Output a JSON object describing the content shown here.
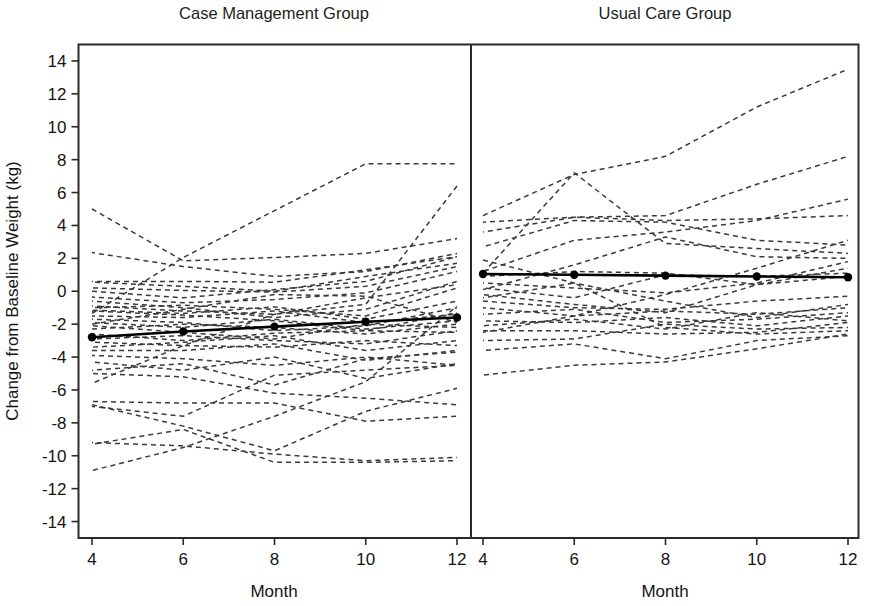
{
  "chart_data": {
    "type": "line",
    "title": "",
    "xlabel": "Month",
    "ylabel": "Change from Baseline Weight (kg)",
    "xlim": [
      3.6,
      12.4
    ],
    "ylim": [
      -15,
      15
    ],
    "xticks": [
      4,
      6,
      8,
      10,
      12
    ],
    "xtick_labels": [
      "4",
      "6",
      "8",
      "10",
      "12"
    ],
    "yticks": [
      14,
      12,
      10,
      8,
      6,
      4,
      2,
      0,
      -2,
      -4,
      -6,
      -8,
      -10,
      -12,
      -14
    ],
    "ytick_labels": [
      "14",
      "12",
      "10",
      "8",
      "6",
      "4",
      "2",
      "0",
      "-2",
      "-4",
      "-6",
      "-8",
      "-10",
      "-12",
      "-14"
    ],
    "grid": false,
    "legend": "none",
    "x": [
      4,
      6,
      8,
      10,
      12
    ],
    "panels": [
      {
        "name": "case-management",
        "title": "Case Management Group",
        "xlabel": "Month",
        "mean_series": {
          "name": "Case Management mean",
          "values": [
            -2.8,
            -2.45,
            -2.15,
            -1.85,
            -1.6
          ],
          "style": "solid-bold-with-markers"
        },
        "individual_series": [
          {
            "values": [
              5.0,
              1.85,
              2.05,
              2.3,
              3.2
            ]
          },
          {
            "values": [
              2.35,
              1.5,
              0.9,
              1.2,
              2.3
            ]
          },
          {
            "values": [
              0.6,
              0.6,
              0.55,
              1.3,
              2.1
            ]
          },
          {
            "values": [
              0.55,
              0.3,
              0.0,
              0.9,
              1.7
            ]
          },
          {
            "values": [
              0.2,
              0.05,
              -0.05,
              0.3,
              1.5
            ]
          },
          {
            "values": [
              0.0,
              -0.4,
              0.1,
              0.6,
              2.1
            ]
          },
          {
            "values": [
              -0.35,
              -0.7,
              -0.5,
              -0.1,
              1.2
            ]
          },
          {
            "values": [
              -0.9,
              -1.2,
              -1.4,
              -0.8,
              6.4
            ]
          },
          {
            "values": [
              -1.0,
              -0.85,
              -1.1,
              -1.5,
              0.2
            ]
          },
          {
            "values": [
              -1.15,
              -1.35,
              -0.95,
              -1.7,
              -0.6
            ]
          },
          {
            "values": [
              -1.35,
              2.05,
              4.9,
              7.75,
              7.75
            ]
          },
          {
            "values": [
              -1.5,
              -1.6,
              -1.2,
              -1.9,
              -1.4
            ]
          },
          {
            "values": [
              -1.7,
              -1.9,
              -2.4,
              -2.1,
              -1.0
            ]
          },
          {
            "values": [
              -1.9,
              -2.2,
              -1.7,
              -2.3,
              -1.8
            ]
          },
          {
            "values": [
              -2.1,
              -2.5,
              -2.9,
              -2.0,
              -2.2
            ]
          },
          {
            "values": [
              -2.3,
              -2.0,
              -2.2,
              -2.6,
              -2.0
            ]
          },
          {
            "values": [
              -2.6,
              -3.0,
              -2.55,
              -2.4,
              -2.5
            ]
          },
          {
            "values": [
              -2.9,
              -2.7,
              -3.0,
              -3.2,
              -2.4
            ]
          },
          {
            "values": [
              -3.1,
              -3.3,
              -3.4,
              -3.0,
              -3.3
            ]
          },
          {
            "values": [
              -3.4,
              -3.1,
              -2.7,
              -3.6,
              -3.0
            ]
          },
          {
            "values": [
              -3.6,
              -3.6,
              -3.2,
              -4.2,
              -3.6
            ]
          },
          {
            "values": [
              -3.9,
              -4.1,
              -4.5,
              -4.0,
              -4.5
            ]
          },
          {
            "values": [
              -4.8,
              -4.4,
              -5.7,
              -4.1,
              -3.7
            ]
          },
          {
            "values": [
              -5.6,
              -3.3,
              -1.4,
              -0.4,
              0.4
            ]
          },
          {
            "values": [
              -6.7,
              -6.8,
              -6.8,
              -7.9,
              -7.6
            ]
          },
          {
            "values": [
              -6.9,
              -8.2,
              -9.7,
              -7.3,
              -5.9
            ]
          },
          {
            "values": [
              -7.0,
              -7.6,
              -5.1,
              -4.8,
              -4.5
            ]
          },
          {
            "values": [
              -9.2,
              -9.4,
              -9.9,
              -10.3,
              -10.1
            ]
          },
          {
            "values": [
              -9.3,
              -8.4,
              -10.4,
              -10.4,
              -10.3
            ]
          },
          {
            "values": [
              -10.9,
              -9.5,
              -7.6,
              -5.5,
              -0.9
            ]
          },
          {
            "values": [
              -2.0,
              -1.1,
              -0.2,
              -0.3,
              -1.9
            ]
          },
          {
            "values": [
              -1.2,
              -1.45,
              -1.8,
              -2.4,
              -1.3
            ]
          },
          {
            "values": [
              -0.6,
              -1.0,
              -1.6,
              -1.1,
              0.6
            ]
          },
          {
            "values": [
              -4.3,
              -4.8,
              -4.0,
              -5.3,
              -4.4
            ]
          },
          {
            "values": [
              -5.0,
              -5.2,
              -6.2,
              -6.5,
              -6.9
            ]
          }
        ]
      },
      {
        "name": "usual-care",
        "title": "Usual Care Group",
        "xlabel": "Month",
        "mean_series": {
          "name": "Usual Care mean",
          "values": [
            1.05,
            1.0,
            0.95,
            0.9,
            0.85
          ],
          "style": "solid-bold-with-markers"
        },
        "individual_series": [
          {
            "values": [
              4.6,
              7.1,
              8.2,
              11.2,
              13.5
            ]
          },
          {
            "values": [
              4.2,
              4.5,
              4.6,
              6.5,
              8.2
            ]
          },
          {
            "values": [
              3.6,
              4.5,
              4.3,
              4.4,
              4.6
            ]
          },
          {
            "values": [
              2.7,
              4.3,
              4.2,
              3.1,
              2.8
            ]
          },
          {
            "values": [
              1.2,
              3.1,
              3.6,
              4.3,
              5.6
            ]
          },
          {
            "values": [
              1.1,
              7.2,
              2.9,
              2.6,
              2.3
            ]
          },
          {
            "values": [
              0.9,
              1.2,
              1.1,
              0.4,
              1.4
            ]
          },
          {
            "values": [
              0.5,
              0.2,
              -0.1,
              0.5,
              1.8
            ]
          },
          {
            "values": [
              0.2,
              -0.4,
              1.0,
              0.9,
              1.1
            ]
          },
          {
            "values": [
              -0.2,
              -0.8,
              -1.3,
              0.4,
              0.9
            ]
          },
          {
            "values": [
              -0.6,
              -1.0,
              -1.1,
              -0.6,
              -0.3
            ]
          },
          {
            "values": [
              -1.0,
              -1.5,
              -1.2,
              -1.4,
              -1.0
            ]
          },
          {
            "values": [
              -1.4,
              -1.1,
              -1.9,
              -1.7,
              -1.3
            ]
          },
          {
            "values": [
              -1.8,
              -1.9,
              -1.6,
              -2.1,
              -1.5
            ]
          },
          {
            "values": [
              -2.1,
              -1.7,
              -2.3,
              -1.3,
              -1.8
            ]
          },
          {
            "values": [
              -2.4,
              -2.4,
              -2.6,
              -2.5,
              -1.9
            ]
          },
          {
            "values": [
              -2.5,
              -1.5,
              -0.2,
              1.4,
              3.1
            ]
          },
          {
            "values": [
              -3.0,
              -2.9,
              -2.0,
              -2.3,
              -2.2
            ]
          },
          {
            "values": [
              -3.6,
              -3.2,
              -4.1,
              -3.0,
              -2.7
            ]
          },
          {
            "values": [
              -5.1,
              -4.5,
              -4.3,
              -3.5,
              -2.6
            ]
          },
          {
            "values": [
              1.9,
              0.5,
              -0.6,
              -1.6,
              -0.8
            ]
          },
          {
            "values": [
              0.1,
              1.6,
              3.3,
              2.1,
              2.0
            ]
          },
          {
            "values": [
              -0.4,
              0.5,
              -2.2,
              -2.6,
              -2.4
            ]
          }
        ]
      }
    ]
  },
  "layout": {
    "panel_left_title": "Case Management Group",
    "panel_right_title": "Usual Care Group",
    "y_axis_title": "Change from Baseline Weight (kg)",
    "x_axis_title_left": "Month",
    "x_axis_title_right": "Month"
  },
  "colors": {
    "frame": "#2a2a2a",
    "mean_line": "#000000",
    "individual_line": "#3a3a3a",
    "background": "#ffffff",
    "text": "#141414"
  }
}
